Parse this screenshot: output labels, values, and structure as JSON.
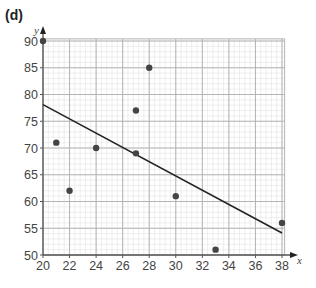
{
  "part_label": "(d)",
  "colors": {
    "minor_grid": "#e2e2e2",
    "major_grid": "#b4b4b4",
    "axis": "#555555",
    "point": "#444444",
    "line": "#222222",
    "text": "#444444"
  },
  "chart_data": {
    "type": "scatter",
    "title": "",
    "xlabel": "x",
    "ylabel": "y",
    "xlim": [
      20,
      38
    ],
    "ylim": [
      50,
      90
    ],
    "grid": true,
    "x_ticks": [
      20,
      22,
      24,
      26,
      28,
      30,
      32,
      34,
      36,
      38
    ],
    "y_ticks": [
      50,
      55,
      60,
      65,
      70,
      75,
      80,
      85,
      90
    ],
    "points": [
      {
        "x": 20,
        "y": 90
      },
      {
        "x": 21,
        "y": 71
      },
      {
        "x": 22,
        "y": 62
      },
      {
        "x": 24,
        "y": 70
      },
      {
        "x": 27,
        "y": 77
      },
      {
        "x": 27,
        "y": 69
      },
      {
        "x": 28,
        "y": 85
      },
      {
        "x": 30,
        "y": 61
      },
      {
        "x": 33,
        "y": 51
      },
      {
        "x": 38,
        "y": 56
      }
    ],
    "line_of_best_fit": {
      "x1": 20,
      "y1": 78.1,
      "x2": 38,
      "y2": 54.1
    }
  }
}
